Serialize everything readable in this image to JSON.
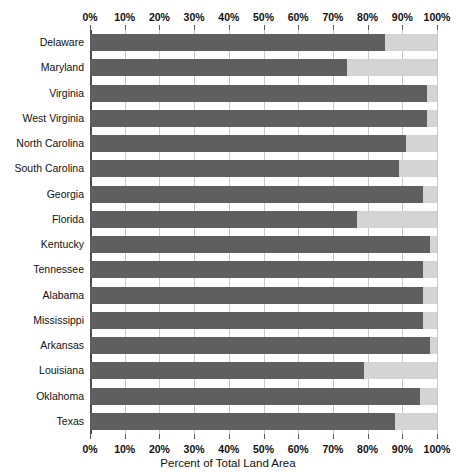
{
  "chart_data": {
    "type": "bar",
    "orientation": "horizontal",
    "stacked": true,
    "title": "",
    "xlabel": "Percent of Total Land Area",
    "ylabel": "",
    "xlim": [
      0,
      100
    ],
    "grid": true,
    "legend": "none",
    "tick_labels": [
      "0%",
      "10%",
      "20%",
      "30%",
      "40%",
      "50%",
      "60%",
      "70%",
      "80%",
      "90%",
      "100%"
    ],
    "tick_values": [
      0,
      10,
      20,
      30,
      40,
      50,
      60,
      70,
      80,
      90,
      100
    ],
    "categories": [
      "Delaware",
      "Maryland",
      "Virginia",
      "West Virginia",
      "North Carolina",
      "South Carolina",
      "Georgia",
      "Florida",
      "Kentucky",
      "Tennessee",
      "Alabama",
      "Mississippi",
      "Arkansas",
      "Louisiana",
      "Oklahoma",
      "Texas"
    ],
    "series": [
      {
        "name": "Primary share",
        "color": "#5f5f5f",
        "values": [
          85,
          74,
          97,
          97,
          91,
          89,
          96,
          77,
          98,
          96,
          96,
          96,
          98,
          79,
          95,
          88
        ]
      },
      {
        "name": "Remainder",
        "color": "#d4d4d4",
        "values": [
          15,
          26,
          3,
          3,
          9,
          11,
          4,
          23,
          2,
          4,
          4,
          4,
          2,
          21,
          5,
          12
        ]
      }
    ]
  },
  "colors": {
    "dark_segment": "#5f5f5f",
    "light_segment": "#d4d4d4",
    "gridline": "#c9c9c9",
    "axis": "#4a4a4a",
    "background": "#ffffff"
  }
}
